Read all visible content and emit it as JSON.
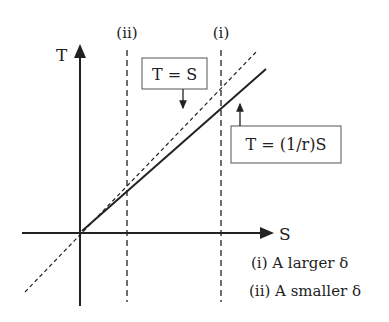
{
  "axes": {
    "x_label": "S",
    "y_label": "T"
  },
  "lines": {
    "identity_label": "T = S",
    "scaled_label": "T = (1/r)S"
  },
  "markers": {
    "i": "(i)",
    "ii": "(ii)"
  },
  "legend": {
    "item_i": "(i) A larger δ",
    "item_ii": "(ii) A smaller δ"
  },
  "colors": {
    "ink": "#222222",
    "background": "#ffffff"
  }
}
